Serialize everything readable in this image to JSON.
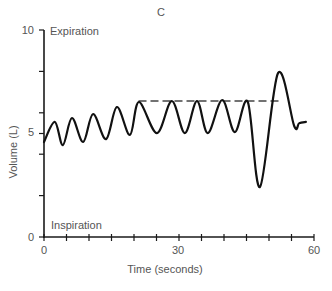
{
  "chart_data": {
    "type": "line",
    "title": "C",
    "xlabel": "Time (seconds)",
    "ylabel": "Volume (L)",
    "xlim": [
      0,
      60
    ],
    "ylim": [
      0,
      10
    ],
    "x_ticks": [
      0,
      5,
      10,
      15,
      20,
      25,
      30,
      35,
      40,
      45,
      50,
      55,
      60
    ],
    "x_tick_labels": {
      "0": "0",
      "30": "30",
      "60": "60"
    },
    "y_ticks": [
      0,
      2,
      4,
      5,
      6,
      8,
      10
    ],
    "y_tick_labels": {
      "0": "0",
      "5": "5",
      "10": "10"
    },
    "grid": false,
    "annotations": [
      {
        "text": "Expiration",
        "position": "top-left"
      },
      {
        "text": "Inspiration",
        "position": "bottom-left"
      }
    ],
    "series": [
      {
        "name": "Lung volume",
        "style": "solid",
        "points": [
          [
            0,
            4.59
          ],
          [
            2.4,
            5.56
          ],
          [
            4.2,
            4.44
          ],
          [
            6.2,
            5.75
          ],
          [
            8.7,
            4.59
          ],
          [
            10.9,
            5.94
          ],
          [
            13.8,
            4.73
          ],
          [
            16.2,
            6.28
          ],
          [
            19.1,
            4.93
          ],
          [
            21.1,
            6.52
          ],
          [
            25.1,
            5.02
          ],
          [
            28.4,
            6.57
          ],
          [
            31.3,
            5.02
          ],
          [
            34.0,
            6.57
          ],
          [
            36.4,
            5.02
          ],
          [
            39.6,
            6.62
          ],
          [
            42.4,
            5.07
          ],
          [
            45.3,
            6.52
          ],
          [
            48.0,
            2.42
          ],
          [
            52.0,
            7.92
          ],
          [
            55.6,
            5.36
          ],
          [
            56.7,
            5.5
          ],
          [
            58.2,
            5.56
          ]
        ]
      },
      {
        "name": "Reference level",
        "style": "dashed",
        "points": [
          [
            21,
            6.57
          ],
          [
            53,
            6.57
          ]
        ]
      }
    ]
  },
  "labels": {
    "title": "C",
    "xlabel": "Time (seconds)",
    "ylabel": "Volume (L)",
    "expiration": "Expiration",
    "inspiration": "Inspiration",
    "y_tick_0": "0",
    "y_tick_5": "5",
    "y_tick_10": "10",
    "x_tick_0": "0",
    "x_tick_30": "30",
    "x_tick_60": "60"
  },
  "layout": {
    "x0_px": 44,
    "x_px_per_unit": 4.5,
    "y0_px": 237,
    "y_px_per_unit": 20.7
  }
}
